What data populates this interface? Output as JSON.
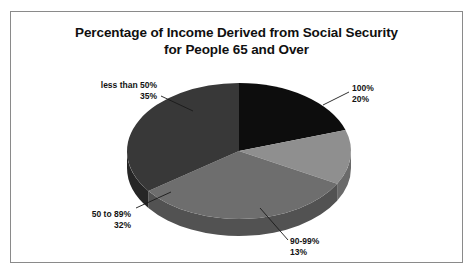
{
  "chart_data": {
    "type": "pie",
    "title": "Percentage of Income Derived from Social Security\nfor People 65 and Over",
    "title_line1": "Percentage of Income Derived from Social Security",
    "title_line2": "for People 65 and Over",
    "xlabel": "",
    "ylabel": "",
    "legend_position": "none",
    "grid": false,
    "three_d": true,
    "units": "percent",
    "categories": [
      "100%",
      "90-99%",
      "50 to 89%",
      "less than 50%"
    ],
    "values": [
      20,
      13,
      32,
      35
    ],
    "slices": [
      {
        "name": "100%",
        "category_label": "100%",
        "value": 20,
        "value_label": "20%",
        "color": "#0d0d0d",
        "side_color": "#000000"
      },
      {
        "name": "90-99%",
        "category_label": "90-99%",
        "value": 13,
        "value_label": "13%",
        "color": "#8f8f8f",
        "side_color": "#6a6a6a"
      },
      {
        "name": "50 to 89%",
        "category_label": "50 to 89%",
        "value": 32,
        "value_label": "32%",
        "color": "#6e6e6e",
        "side_color": "#525252"
      },
      {
        "name": "less than 50%",
        "category_label": "less than 50%",
        "value": 35,
        "value_label": "35%",
        "color": "#383838",
        "side_color": "#262626"
      }
    ],
    "annotations": [
      {
        "text": "less than 50%\n35%",
        "target": "less than 50%"
      },
      {
        "text": "100%\n20%",
        "target": "100%"
      },
      {
        "text": "50 to 89%\n32%",
        "target": "50 to 89%"
      },
      {
        "text": "90-99%\n13%",
        "target": "90-99%"
      }
    ]
  },
  "labels": {
    "less_than_50": "less than 50%\n35%",
    "hundred": "100%\n20%",
    "fifty_to_89": "50 to 89%\n32%",
    "ninety_to_99": "90-99%\n13%"
  },
  "frame": {
    "border_color": "#8a8a8a",
    "background": "#ffffff"
  }
}
